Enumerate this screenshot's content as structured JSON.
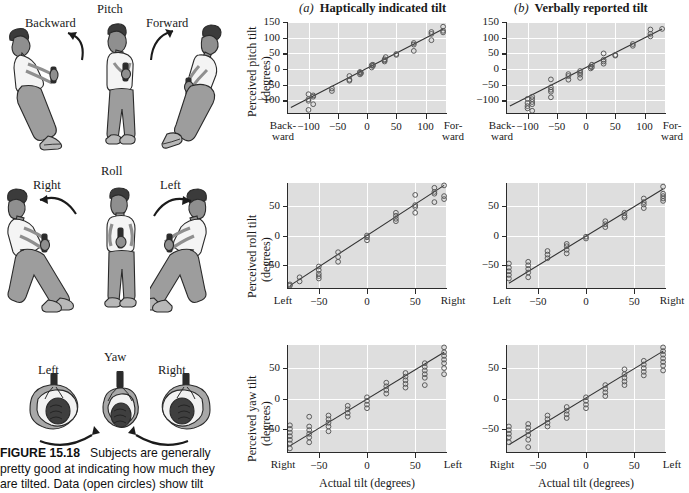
{
  "figure": {
    "caption_label": "FIGURE 15.18",
    "caption_text": "Subjects are generally pretty good at indicating how much they are tilted. Data (open circles) show tilt"
  },
  "illustrations": [
    {
      "axis_name": "Pitch",
      "left_label": "Backward",
      "right_label": "Forward",
      "view": "side-view-standing"
    },
    {
      "axis_name": "Roll",
      "left_label": "Right",
      "right_label": "Left",
      "view": "front-view-standing"
    },
    {
      "axis_name": "Yaw",
      "left_label": "Left",
      "right_label": "Right",
      "view": "top-view-head"
    }
  ],
  "columns": [
    {
      "letter": "(a)",
      "title": "Haptically indicated tilt"
    },
    {
      "letter": "(b)",
      "title": "Verbally reported tilt"
    }
  ],
  "axis_titles": {
    "x": "Actual tilt (degrees)",
    "y_pitch_1": "Perceived pitch tilt",
    "y_pitch_2": "(degrees)",
    "y_roll_1": "Perceived roll tilt",
    "y_roll_2": "(degrees)",
    "y_yaw_1": "Perceived yaw tilt",
    "y_yaw_2": "(degrees)"
  },
  "chart_data": [
    {
      "id": "pitch-haptic",
      "type": "scatter",
      "title": "Haptically indicated tilt",
      "panel_letter": "(a)",
      "xlabel": "Actual tilt (degrees)",
      "ylabel": "Perceived pitch tilt (degrees)",
      "xlim": [
        -135,
        135
      ],
      "ylim": [
        -140,
        150
      ],
      "xticks": [
        -100,
        -50,
        0,
        50,
        100
      ],
      "xticklabels": [
        "−100",
        "−50",
        "0",
        "50",
        "100"
      ],
      "xend_labels": [
        "Back-\nward",
        "For-\nward"
      ],
      "yticks": [
        -100,
        -50,
        0,
        50,
        100,
        150
      ],
      "yticklabels": [
        "−100",
        "−50",
        "0",
        "50",
        "100",
        "150"
      ],
      "grid": true,
      "fit_line": {
        "x": [
          -130,
          130
        ],
        "y": [
          -122,
          128
        ]
      },
      "points": [
        [
          -100,
          -80
        ],
        [
          -100,
          -96
        ],
        [
          -100,
          -101
        ],
        [
          -100,
          -130
        ],
        [
          -92,
          -84
        ],
        [
          -92,
          -88
        ],
        [
          -92,
          -112
        ],
        [
          -60,
          -62
        ],
        [
          -60,
          -70
        ],
        [
          -30,
          -22
        ],
        [
          -30,
          -34
        ],
        [
          -30,
          -37
        ],
        [
          -12,
          -9
        ],
        [
          -12,
          -12
        ],
        [
          -12,
          -17
        ],
        [
          -10,
          -13
        ],
        [
          8,
          12
        ],
        [
          8,
          5
        ],
        [
          10,
          10
        ],
        [
          10,
          14
        ],
        [
          30,
          28
        ],
        [
          30,
          24
        ],
        [
          30,
          31
        ],
        [
          32,
          38
        ],
        [
          50,
          45
        ],
        [
          50,
          48
        ],
        [
          80,
          83
        ],
        [
          80,
          78
        ],
        [
          80,
          58
        ],
        [
          110,
          112
        ],
        [
          110,
          118
        ],
        [
          110,
          92
        ],
        [
          130,
          135
        ],
        [
          130,
          122
        ],
        [
          130,
          117
        ]
      ]
    },
    {
      "id": "pitch-verbal",
      "type": "scatter",
      "title": "Verbally reported tilt",
      "panel_letter": "(b)",
      "xlabel": "Actual tilt (degrees)",
      "ylabel": "Perceived pitch tilt (degrees)",
      "xlim": [
        -135,
        135
      ],
      "ylim": [
        -140,
        150
      ],
      "xticks": [
        -100,
        -50,
        0,
        50,
        100
      ],
      "xticklabels": [
        "−100",
        "−50",
        "0",
        "50",
        "100"
      ],
      "xend_labels": [
        "Back-\nward",
        "For-\nward"
      ],
      "yticks": [
        -100,
        -50,
        0,
        50,
        100,
        150
      ],
      "yticklabels": [
        "−100",
        "−50",
        "0",
        "50",
        "100",
        "150"
      ],
      "grid": true,
      "fit_line": {
        "x": [
          -130,
          130
        ],
        "y": [
          -118,
          128
        ]
      },
      "points": [
        [
          -100,
          -95
        ],
        [
          -100,
          -108
        ],
        [
          -100,
          -118
        ],
        [
          -100,
          -125
        ],
        [
          -92,
          -88
        ],
        [
          -92,
          -96
        ],
        [
          -92,
          -105
        ],
        [
          -92,
          -112
        ],
        [
          -92,
          -133
        ],
        [
          -60,
          -33
        ],
        [
          -60,
          -58
        ],
        [
          -60,
          -66
        ],
        [
          -60,
          -72
        ],
        [
          -60,
          -90
        ],
        [
          -30,
          -16
        ],
        [
          -30,
          -22
        ],
        [
          -30,
          -34
        ],
        [
          -10,
          -6
        ],
        [
          -10,
          -12
        ],
        [
          -10,
          -18
        ],
        [
          -10,
          -28
        ],
        [
          8,
          8
        ],
        [
          8,
          2
        ],
        [
          10,
          14
        ],
        [
          10,
          6
        ],
        [
          30,
          50
        ],
        [
          30,
          30
        ],
        [
          30,
          24
        ],
        [
          30,
          17
        ],
        [
          50,
          43
        ],
        [
          50,
          45
        ],
        [
          80,
          80
        ],
        [
          80,
          74
        ],
        [
          110,
          126
        ],
        [
          110,
          112
        ],
        [
          110,
          104
        ],
        [
          130,
          128
        ]
      ]
    },
    {
      "id": "roll-haptic",
      "type": "scatter",
      "title": "Haptically indicated tilt",
      "panel_letter": "(a)",
      "xlabel": "Actual tilt (degrees)",
      "ylabel": "Perceived roll tilt (degrees)",
      "xlim": [
        -82,
        82
      ],
      "ylim": [
        -88,
        88
      ],
      "xticks": [
        -50,
        0,
        50
      ],
      "xticklabels": [
        "−50",
        "0",
        "50"
      ],
      "xend_labels": [
        "Left",
        "Right"
      ],
      "yticks": [
        -50,
        0,
        50
      ],
      "yticklabels": [
        "−50",
        "0",
        "50"
      ],
      "grid": true,
      "fit_line": {
        "x": [
          -80,
          80
        ],
        "y": [
          -84,
          84
        ]
      },
      "points": [
        [
          -80,
          -84
        ],
        [
          -80,
          -82
        ],
        [
          -70,
          -70
        ],
        [
          -70,
          -77
        ],
        [
          -50,
          -52
        ],
        [
          -50,
          -58
        ],
        [
          -50,
          -64
        ],
        [
          -50,
          -68
        ],
        [
          -50,
          -72
        ],
        [
          -30,
          -28
        ],
        [
          -30,
          -36
        ],
        [
          -30,
          -44
        ],
        [
          0,
          0
        ],
        [
          0,
          -3
        ],
        [
          0,
          -8
        ],
        [
          30,
          38
        ],
        [
          30,
          33
        ],
        [
          30,
          28
        ],
        [
          30,
          24
        ],
        [
          50,
          68
        ],
        [
          50,
          51
        ],
        [
          50,
          48
        ],
        [
          50,
          38
        ],
        [
          70,
          80
        ],
        [
          70,
          73
        ],
        [
          70,
          70
        ],
        [
          70,
          56
        ],
        [
          80,
          84
        ],
        [
          80,
          66
        ],
        [
          80,
          61
        ]
      ]
    },
    {
      "id": "roll-verbal",
      "type": "scatter",
      "title": "Verbally reported tilt",
      "panel_letter": "(b)",
      "xlabel": "Actual tilt (degrees)",
      "ylabel": "Perceived roll tilt (degrees)",
      "xlim": [
        -82,
        82
      ],
      "ylim": [
        -88,
        88
      ],
      "xticks": [
        -50,
        0,
        50
      ],
      "xticklabels": [
        "−50",
        "0",
        "50"
      ],
      "xend_labels": [
        "Left",
        "Right"
      ],
      "yticks": [
        -50,
        0,
        50
      ],
      "yticklabels": [
        "−50",
        "0",
        "50"
      ],
      "grid": true,
      "fit_line": {
        "x": [
          -80,
          80
        ],
        "y": [
          -80,
          78
        ]
      },
      "points": [
        [
          -80,
          -47
        ],
        [
          -80,
          -54
        ],
        [
          -80,
          -60
        ],
        [
          -80,
          -66
        ],
        [
          -80,
          -72
        ],
        [
          -60,
          -44
        ],
        [
          -60,
          -50
        ],
        [
          -60,
          -56
        ],
        [
          -60,
          -62
        ],
        [
          -60,
          -70
        ],
        [
          -40,
          -26
        ],
        [
          -40,
          -32
        ],
        [
          -40,
          -38
        ],
        [
          -20,
          -14
        ],
        [
          -20,
          -18
        ],
        [
          -20,
          -24
        ],
        [
          -20,
          -30
        ],
        [
          0,
          -2
        ],
        [
          0,
          -5
        ],
        [
          20,
          24
        ],
        [
          20,
          19
        ],
        [
          20,
          14
        ],
        [
          40,
          38
        ],
        [
          40,
          33
        ],
        [
          40,
          30
        ],
        [
          60,
          62
        ],
        [
          60,
          56
        ],
        [
          60,
          52
        ],
        [
          60,
          46
        ],
        [
          80,
          82
        ],
        [
          80,
          70
        ],
        [
          80,
          66
        ],
        [
          80,
          62
        ],
        [
          80,
          58
        ]
      ]
    },
    {
      "id": "yaw-haptic",
      "type": "scatter",
      "title": "Haptically indicated tilt",
      "panel_letter": "(a)",
      "xlabel": "Actual tilt (degrees)",
      "ylabel": "Perceived yaw tilt (degrees)",
      "xlim": [
        -82,
        82
      ],
      "ylim": [
        -88,
        88
      ],
      "xticks": [
        -50,
        0,
        50
      ],
      "xticklabels": [
        "−50",
        "0",
        "50"
      ],
      "xend_labels": [
        "Right",
        "Left"
      ],
      "yticks": [
        -50,
        0,
        50
      ],
      "yticklabels": [
        "−50",
        "0",
        "50"
      ],
      "grid": true,
      "fit_line": {
        "x": [
          -80,
          80
        ],
        "y": [
          -78,
          76
        ]
      },
      "points": [
        [
          -80,
          -44
        ],
        [
          -80,
          -50
        ],
        [
          -80,
          -56
        ],
        [
          -80,
          -62
        ],
        [
          -80,
          -68
        ],
        [
          -80,
          -74
        ],
        [
          -80,
          -82
        ],
        [
          -60,
          -30
        ],
        [
          -60,
          -46
        ],
        [
          -60,
          -52
        ],
        [
          -60,
          -58
        ],
        [
          -60,
          -64
        ],
        [
          -60,
          -72
        ],
        [
          -40,
          -28
        ],
        [
          -40,
          -34
        ],
        [
          -40,
          -40
        ],
        [
          -40,
          -46
        ],
        [
          -40,
          -54
        ],
        [
          -20,
          -12
        ],
        [
          -20,
          -18
        ],
        [
          -20,
          -24
        ],
        [
          -20,
          -30
        ],
        [
          0,
          2
        ],
        [
          0,
          -4
        ],
        [
          0,
          -10
        ],
        [
          0,
          -16
        ],
        [
          20,
          26
        ],
        [
          20,
          20
        ],
        [
          20,
          14
        ],
        [
          20,
          8
        ],
        [
          40,
          42
        ],
        [
          40,
          36
        ],
        [
          40,
          30
        ],
        [
          40,
          24
        ],
        [
          40,
          18
        ],
        [
          60,
          58
        ],
        [
          60,
          52
        ],
        [
          60,
          46
        ],
        [
          60,
          40
        ],
        [
          60,
          34
        ],
        [
          60,
          22
        ],
        [
          80,
          84
        ],
        [
          80,
          76
        ],
        [
          80,
          70
        ],
        [
          80,
          64
        ],
        [
          80,
          58
        ],
        [
          80,
          50
        ],
        [
          80,
          40
        ]
      ]
    },
    {
      "id": "yaw-verbal",
      "type": "scatter",
      "title": "Verbally reported tilt",
      "panel_letter": "(b)",
      "xlabel": "Actual tilt (degrees)",
      "ylabel": "Perceived yaw tilt (degrees)",
      "xlim": [
        -82,
        82
      ],
      "ylim": [
        -88,
        88
      ],
      "xticks": [
        -50,
        0,
        50
      ],
      "xticklabels": [
        "−50",
        "0",
        "50"
      ],
      "xend_labels": [
        "Right",
        "Left"
      ],
      "yticks": [
        -50,
        0,
        50
      ],
      "yticklabels": [
        "−50",
        "0",
        "50"
      ],
      "grid": true,
      "fit_line": {
        "x": [
          -80,
          80
        ],
        "y": [
          -76,
          78
        ]
      },
      "points": [
        [
          -80,
          -46
        ],
        [
          -80,
          -52
        ],
        [
          -80,
          -58
        ],
        [
          -80,
          -64
        ],
        [
          -80,
          -72
        ],
        [
          -60,
          -42
        ],
        [
          -60,
          -48
        ],
        [
          -60,
          -54
        ],
        [
          -60,
          -60
        ],
        [
          -60,
          -68
        ],
        [
          -60,
          -80
        ],
        [
          -40,
          -28
        ],
        [
          -40,
          -34
        ],
        [
          -40,
          -40
        ],
        [
          -40,
          -46
        ],
        [
          -20,
          -14
        ],
        [
          -20,
          -20
        ],
        [
          -20,
          -26
        ],
        [
          -20,
          -32
        ],
        [
          0,
          2
        ],
        [
          0,
          -4
        ],
        [
          0,
          -10
        ],
        [
          0,
          -16
        ],
        [
          20,
          22
        ],
        [
          20,
          16
        ],
        [
          20,
          10
        ],
        [
          20,
          4
        ],
        [
          40,
          48
        ],
        [
          40,
          40
        ],
        [
          40,
          34
        ],
        [
          40,
          28
        ],
        [
          40,
          22
        ],
        [
          60,
          62
        ],
        [
          60,
          56
        ],
        [
          60,
          50
        ],
        [
          60,
          44
        ],
        [
          60,
          38
        ],
        [
          80,
          84
        ],
        [
          80,
          78
        ],
        [
          80,
          72
        ],
        [
          80,
          66
        ],
        [
          80,
          60
        ],
        [
          80,
          54
        ],
        [
          80,
          46
        ]
      ]
    }
  ],
  "colors": {
    "plot_background": "#dedede",
    "gridline": "#ffffff",
    "axis": "#2b2b2b",
    "marker_stroke": "#555555",
    "fit_line": "#333333",
    "skin": "#8c8c8c",
    "clothing_light": "#f2f2f2",
    "clothing_dark": "#9a9a9a",
    "hair": "#3a3a3a"
  }
}
